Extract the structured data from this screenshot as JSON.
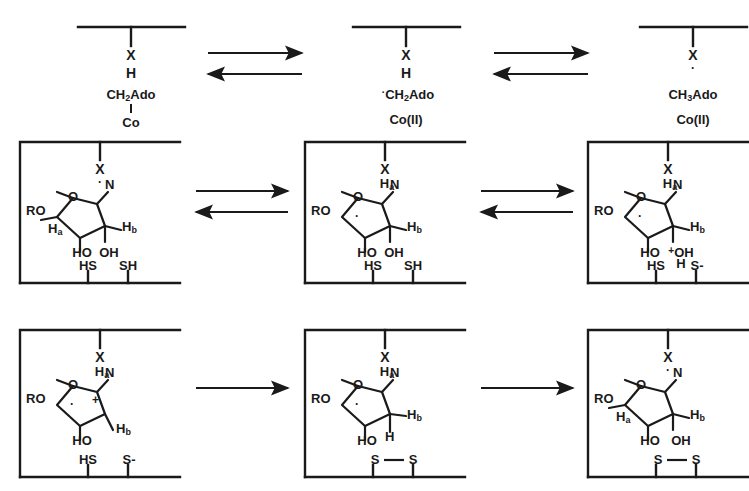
{
  "figure": {
    "type": "reaction-mechanism",
    "grid": {
      "rows": 3,
      "cols": 3
    },
    "line_color": "#1a1a1a",
    "background": "#ffffff"
  },
  "row1": {
    "panel1": {
      "enzyme_radical": "X",
      "hydrogen": "H",
      "cofactor": "CH",
      "cofactor_sub": "2",
      "cofactor_rest": "Ado",
      "metal": "Co"
    },
    "panel2": {
      "enzyme_radical": "X",
      "hydrogen": "H",
      "radical_dot": "·",
      "cofactor": "CH",
      "cofactor_sub": "2",
      "cofactor_rest": "Ado",
      "metal": "Co(II)"
    },
    "panel3": {
      "enzyme_radical": "X",
      "radical_dot": "·",
      "cofactor": "CH",
      "cofactor_sub": "3",
      "cofactor_rest": "Ado",
      "metal": "Co(II)"
    }
  },
  "row2": {
    "panel1": {
      "enzyme": "X",
      "enzyme_dot": "·",
      "ro": "RO",
      "ring_o": "O",
      "base_n": "N",
      "h_a": "H",
      "h_a_sub": "a",
      "h_b": "H",
      "h_b_sub": "b",
      "oh_left": "HO",
      "oh_right": "OH",
      "thiol_left": "HS",
      "thiol_right": "SH"
    },
    "panel2": {
      "enzyme": "X",
      "h_on_x": "H",
      "h_on_x_sub": "a",
      "ro": "RO",
      "ring_o": "O",
      "base_n": "N",
      "ring_dot": "·",
      "h_b": "H",
      "h_b_sub": "b",
      "oh_left": "HO",
      "oh_right": "OH",
      "thiol_left": "HS",
      "thiol_right": "SH"
    },
    "panel3": {
      "enzyme": "X",
      "h_on_x": "H",
      "h_on_x_sub": "a",
      "ro": "RO",
      "ring_o": "O",
      "base_n": "N",
      "ring_dot": "·",
      "h_b": "H",
      "h_b_sub": "b",
      "oh_left": "HO",
      "oh_right_charge": "+",
      "oh_right": "OH",
      "oh_right_h": "H",
      "thiol_left": "HS",
      "thiol_right": "S-"
    }
  },
  "row3": {
    "panel1": {
      "enzyme": "X",
      "h_on_x": "H",
      "h_on_x_sub": "a",
      "ro": "RO",
      "ring_o": "O",
      "base_n": "N",
      "ring_dot": "·",
      "cation": "+",
      "h_b": "H",
      "h_b_sub": "b",
      "oh_left": "HO",
      "thiol_left": "HS",
      "thiol_right": "S-"
    },
    "panel2": {
      "enzyme": "X",
      "h_on_x": "H",
      "h_on_x_sub": "a",
      "ro": "RO",
      "ring_o": "O",
      "base_n": "N",
      "ring_dot": "·",
      "h_b": "H",
      "h_b_sub": "b",
      "h_extra": "H",
      "oh_left": "HO",
      "disulfide_left": "S",
      "disulfide_right": "S"
    },
    "panel3": {
      "enzyme": "X",
      "enzyme_dot": "·",
      "ro": "RO",
      "ring_o": "O",
      "base_n": "N",
      "h_a": "H",
      "h_a_sub": "a",
      "h_b": "H",
      "h_b_sub": "b",
      "oh_left": "HO",
      "oh_right": "OH",
      "disulfide_left": "S",
      "disulfide_right": "S"
    }
  },
  "arrows": {
    "row1_left": "equilibrium",
    "row1_right": "equilibrium",
    "row2_left": "equilibrium",
    "row2_right": "equilibrium",
    "row3_left": "forward",
    "row3_right": "forward"
  }
}
